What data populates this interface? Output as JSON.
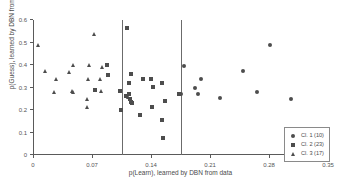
{
  "chart_data": {
    "type": "scatter",
    "title": "",
    "xlabel": "p(Learn), learned by DBN from data",
    "ylabel": "p(Guess), learned by DBN from data",
    "xlim": [
      0,
      0.35
    ],
    "ylim": [
      0,
      0.6
    ],
    "xticks": [
      0,
      0.07,
      0.14,
      0.21,
      0.28,
      0.35
    ],
    "xtick_labels": [
      "0",
      "0.07",
      "0.14",
      "0.21",
      "0.28",
      "0.35"
    ],
    "yticks": [
      0,
      0.1,
      0.2,
      0.3,
      0.4,
      0.5,
      0.6
    ],
    "ytick_labels": [
      "0",
      "0.1",
      "0.2",
      "0.3",
      "0.4",
      "0.5",
      "0.6"
    ],
    "grid": false,
    "legend_position": "lower-right",
    "annotations": [
      {
        "name": "cluster-divider-1",
        "type": "vline",
        "x": 0.105
      },
      {
        "name": "cluster-divider-2",
        "type": "vline",
        "x": 0.175
      }
    ],
    "series": [
      {
        "name": "Cl. 1 (10)",
        "label": "Cl. 1 (10)",
        "marker": "circle",
        "count": 10,
        "color": "#4d4d4d",
        "points": [
          {
            "x": 0.1795,
            "y": 0.404
          },
          {
            "x": 0.192,
            "y": 0.305
          },
          {
            "x": 0.1955,
            "y": 0.279
          },
          {
            "x": 0.199,
            "y": 0.348
          },
          {
            "x": 0.2215,
            "y": 0.264
          },
          {
            "x": 0.249,
            "y": 0.384
          },
          {
            "x": 0.266,
            "y": 0.289
          },
          {
            "x": 0.2815,
            "y": 0.499
          },
          {
            "x": 0.306,
            "y": 0.257
          },
          {
            "x": 0.1755,
            "y": 0.279
          }
        ]
      },
      {
        "name": "Cl. 2 (23)",
        "label": "Cl. 2 (23)",
        "marker": "square",
        "count": 23,
        "color": "#4d4d4d",
        "points": [
          {
            "x": 0.0735,
            "y": 0.298
          },
          {
            "x": 0.088,
            "y": 0.411
          },
          {
            "x": 0.0895,
            "y": 0.365
          },
          {
            "x": 0.111,
            "y": 0.573
          },
          {
            "x": 0.116,
            "y": 0.368
          },
          {
            "x": 0.114,
            "y": 0.33
          },
          {
            "x": 0.1035,
            "y": 0.292
          },
          {
            "x": 0.11,
            "y": 0.272
          },
          {
            "x": 0.1135,
            "y": 0.279
          },
          {
            "x": 0.1145,
            "y": 0.258
          },
          {
            "x": 0.116,
            "y": 0.245
          },
          {
            "x": 0.1175,
            "y": 0.24
          },
          {
            "x": 0.1045,
            "y": 0.208
          },
          {
            "x": 0.1275,
            "y": 0.188
          },
          {
            "x": 0.1305,
            "y": 0.345
          },
          {
            "x": 0.14,
            "y": 0.346
          },
          {
            "x": 0.142,
            "y": 0.312
          },
          {
            "x": 0.1525,
            "y": 0.331
          },
          {
            "x": 0.1415,
            "y": 0.222
          },
          {
            "x": 0.1565,
            "y": 0.248
          },
          {
            "x": 0.153,
            "y": 0.163
          },
          {
            "x": 0.1545,
            "y": 0.086
          },
          {
            "x": 0.1735,
            "y": 0.279
          }
        ]
      },
      {
        "name": "Cl. 3 (17)",
        "label": "Cl. 3 (17)",
        "marker": "triangle",
        "count": 17,
        "color": "#4d4d4d",
        "points": [
          {
            "x": 0.0055,
            "y": 0.498
          },
          {
            "x": 0.0145,
            "y": 0.383
          },
          {
            "x": 0.027,
            "y": 0.347
          },
          {
            "x": 0.0255,
            "y": 0.287
          },
          {
            "x": 0.043,
            "y": 0.379
          },
          {
            "x": 0.048,
            "y": 0.409
          },
          {
            "x": 0.046,
            "y": 0.293
          },
          {
            "x": 0.048,
            "y": 0.291
          },
          {
            "x": 0.066,
            "y": 0.409
          },
          {
            "x": 0.0655,
            "y": 0.347
          },
          {
            "x": 0.0645,
            "y": 0.256
          },
          {
            "x": 0.0635,
            "y": 0.222
          },
          {
            "x": 0.072,
            "y": 0.546
          },
          {
            "x": 0.079,
            "y": 0.345
          },
          {
            "x": 0.0815,
            "y": 0.402
          },
          {
            "x": 0.0805,
            "y": 0.292
          },
          {
            "x": 0.1125,
            "y": 0.268
          }
        ]
      }
    ]
  }
}
